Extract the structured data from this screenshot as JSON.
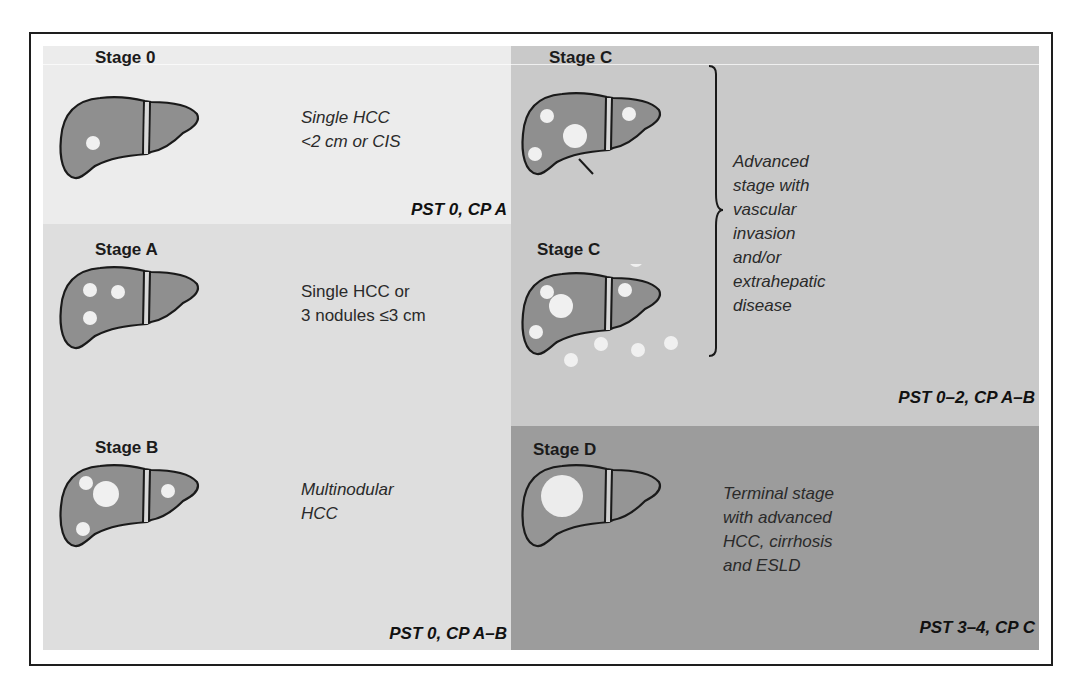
{
  "diagram": {
    "colors": {
      "frame_border": "#1e1e1e",
      "stage0_bg": "#ececec",
      "stageAB_bg": "#dedede",
      "stageC_bg": "#c9c9c9",
      "stageD_bg": "#9c9c9c",
      "liver_fill": "#8f8f8f",
      "liver_outline": "#1a1a1a",
      "nodule_fill": "#f0f0f0"
    },
    "stages": [
      {
        "id": "stage-0",
        "title": "Stage 0",
        "description_lines": [
          "Single HCC",
          "<2 cm or CIS"
        ],
        "description_italic": true,
        "criteria": "PST 0, CP A",
        "icon": "liver-single-small-nodule-icon"
      },
      {
        "id": "stage-a",
        "title": "Stage A",
        "description_lines": [
          "Single HCC or",
          "3 nodules ≤3 cm"
        ],
        "description_italic": false,
        "icon": "liver-three-nodules-icon"
      },
      {
        "id": "stage-b",
        "title": "Stage B",
        "description_lines": [
          "Multinodular",
          "HCC"
        ],
        "description_italic": true,
        "criteria": "PST 0, CP A–B",
        "icon": "liver-multinodular-icon"
      },
      {
        "id": "stage-c-vascular",
        "title": "Stage C",
        "icon": "liver-vascular-invasion-icon"
      },
      {
        "id": "stage-c-extrahepatic",
        "title": "Stage C",
        "icon": "liver-extrahepatic-spread-icon"
      },
      {
        "id": "stage-d",
        "title": "Stage D",
        "description_lines": [
          "Terminal stage",
          "with advanced",
          "HCC, cirrhosis",
          "and ESLD"
        ],
        "description_italic": true,
        "criteria": "PST 3–4, CP C",
        "icon": "liver-large-tumor-icon"
      }
    ],
    "stage_c_shared": {
      "description_lines": [
        "Advanced",
        "stage with",
        "vascular",
        "invasion",
        "and/or",
        "extrahepatic",
        "disease"
      ],
      "description_italic": true,
      "criteria": "PST 0–2, CP A–B",
      "brace": "right-curly-brace-icon"
    }
  }
}
